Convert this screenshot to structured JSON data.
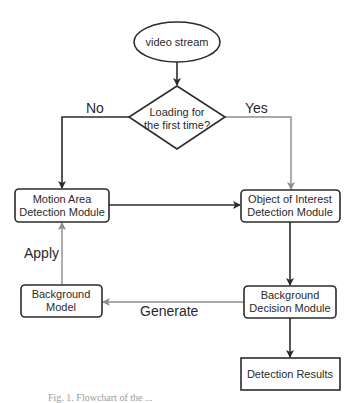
{
  "diagram": {
    "type": "flowchart",
    "colors": {
      "dark": "#2b2b2b",
      "grey": "#8c8c8c",
      "background": "#ffffff"
    },
    "nodes": {
      "start": {
        "shape": "ellipse",
        "lines": [
          "video stream"
        ]
      },
      "decision": {
        "shape": "diamond",
        "lines": [
          "Loading for",
          "the first time?"
        ]
      },
      "motion": {
        "shape": "rounded-rect",
        "lines": [
          "Motion Area",
          "Detection Module"
        ]
      },
      "object": {
        "shape": "rounded-rect",
        "lines": [
          "Object of Interest",
          "Detection Module"
        ]
      },
      "bgmodel": {
        "shape": "rounded-rect",
        "lines": [
          "Background",
          "Model"
        ]
      },
      "bgdecision": {
        "shape": "rounded-rect",
        "lines": [
          "Background",
          "Decision Module"
        ]
      },
      "results": {
        "shape": "rect",
        "lines": [
          "Detection Results"
        ]
      }
    },
    "edges": [
      {
        "from": "start",
        "to": "decision",
        "label": "",
        "color": "dark"
      },
      {
        "from": "decision",
        "to": "motion",
        "label": "No",
        "color": "dark"
      },
      {
        "from": "decision",
        "to": "object",
        "label": "Yes",
        "color": "grey"
      },
      {
        "from": "motion",
        "to": "object",
        "label": "",
        "color": "dark"
      },
      {
        "from": "object",
        "to": "bgdecision",
        "label": "",
        "color": "dark"
      },
      {
        "from": "bgdecision",
        "to": "bgmodel",
        "label": "Generate",
        "color": "grey"
      },
      {
        "from": "bgmodel",
        "to": "motion",
        "label": "Apply",
        "color": "grey"
      },
      {
        "from": "bgdecision",
        "to": "results",
        "label": "",
        "color": "dark"
      }
    ],
    "labels": {
      "no": "No",
      "yes": "Yes",
      "apply": "Apply",
      "generate": "Generate"
    },
    "caption": "Fig. 1. Flowchart of the ..."
  }
}
